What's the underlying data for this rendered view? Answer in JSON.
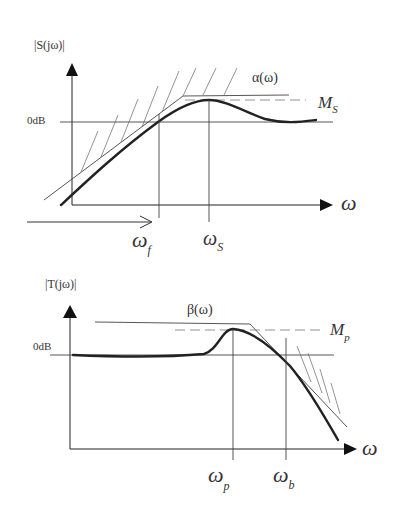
{
  "top_plot": {
    "y_label": "|S(jω)|",
    "zero_db_label": "0dB",
    "x_label": "ω",
    "bound_label": "α(ω)",
    "peak_label_main": "M",
    "peak_label_sub": "S",
    "freq_f_main": "ω",
    "freq_f_sub": "f",
    "freq_s_main": "ω",
    "freq_s_sub": "S"
  },
  "bottom_plot": {
    "y_label": "|T(jω)|",
    "zero_db_label": "0dB",
    "x_label": "ω",
    "bound_label": "β(ω)",
    "peak_label_main": "M",
    "peak_label_sub": "p",
    "freq_p_main": "ω",
    "freq_p_sub": "p",
    "freq_b_main": "ω",
    "freq_b_sub": "b"
  }
}
